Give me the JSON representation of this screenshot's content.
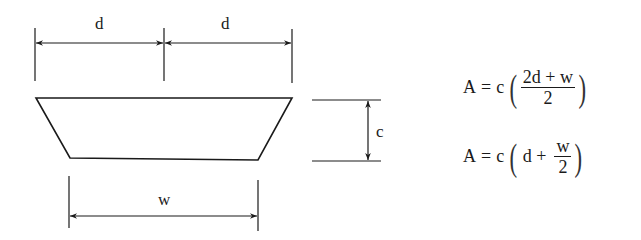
{
  "diagram": {
    "labels": {
      "top_left_dim": "d",
      "top_right_dim": "d",
      "height_dim": "c",
      "bottom_dim": "w"
    },
    "stroke_color": "#1a1a1a",
    "background": "#ffffff"
  },
  "formulas": [
    {
      "lhs": "A",
      "eq": "=",
      "coef": "c",
      "numerator": "2d + w",
      "denominator": "2"
    },
    {
      "lhs": "A",
      "eq": "=",
      "coef": "c",
      "term": "d +",
      "numerator": "w",
      "denominator": "2"
    }
  ]
}
